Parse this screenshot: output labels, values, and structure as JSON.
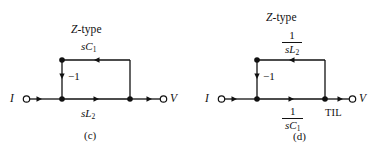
{
  "figures": [
    {
      "id": "c",
      "title": "Z-type",
      "caption": "(c)",
      "input_terminal": "I",
      "output_terminal": "V",
      "feedback_gain": "−1",
      "top_branch": {
        "style": "inline",
        "text": "sC",
        "sub": "1"
      },
      "bottom_branch": {
        "style": "inline",
        "text": "sL",
        "sub": "2"
      },
      "tag": ""
    },
    {
      "id": "d",
      "title": "Z-type",
      "caption": "(d)",
      "input_terminal": "I",
      "output_terminal": "V",
      "feedback_gain": "−1",
      "top_branch": {
        "style": "fraction",
        "numerator": "1",
        "denominator": "sL",
        "sub": "2"
      },
      "bottom_branch": {
        "style": "fraction",
        "numerator": "1",
        "denominator": "sC",
        "sub": "1"
      },
      "tag": "TIL"
    }
  ],
  "colors": {
    "ink": "#111111",
    "background": "#ffffff"
  }
}
